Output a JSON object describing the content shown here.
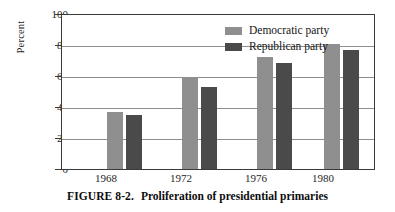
{
  "caption": {
    "figure_number": "FIGURE 8-2.",
    "text": "Proliferation of presidential primaries"
  },
  "chart_data": {
    "type": "bar",
    "title": "",
    "xlabel": "",
    "ylabel": "Percent",
    "categories": [
      "1968",
      "1972",
      "1976",
      "1980"
    ],
    "series": [
      {
        "name": "Democratic party",
        "color": "#8f8f8f",
        "values": [
          37,
          60,
          73,
          81
        ]
      },
      {
        "name": "Republican party",
        "color": "#4a4a4a",
        "values": [
          35,
          53,
          69,
          77
        ]
      }
    ],
    "ylim": [
      0,
      100
    ],
    "yticks": [
      "0",
      "20",
      "40",
      "60",
      "80",
      "100"
    ],
    "ytick_values": [
      0,
      20,
      40,
      60,
      80,
      100
    ],
    "grid": true,
    "legend_position": "top-center-inside"
  }
}
